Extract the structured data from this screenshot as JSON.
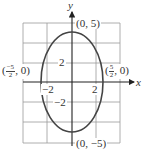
{
  "figure": {
    "type": "ellipse-graph",
    "equation_hint": "x^2/(5/2)^2 + y^2/5^2 = 1",
    "center": [
      0,
      0
    ],
    "semi_axis_x": 2.5,
    "semi_axis_y": 5
  },
  "axes": {
    "x_label": "x",
    "y_label": "y",
    "tick_labels": {
      "x_neg": "−2",
      "x_pos": "2",
      "y_pos": "2",
      "y_neg": "−2"
    },
    "grid": true,
    "grid_x_step": 2,
    "grid_y_step": 2,
    "x_range": [
      -4,
      4
    ],
    "y_range": [
      -6,
      6
    ]
  },
  "points": {
    "top": {
      "open": "(",
      "text": "0, 5",
      "close": ")"
    },
    "bottom": {
      "open": "(",
      "text": "0, −5",
      "close": ")"
    },
    "left": {
      "open": "(",
      "num": "−5",
      "den": "2",
      "rest": ", 0)"
    },
    "right": {
      "open": "(",
      "num": "5",
      "den": "2",
      "rest": ", 0)"
    }
  },
  "colors": {
    "grid": "#9a9a9a",
    "axis": "#222222",
    "curve": "#444444",
    "text": "#333333"
  }
}
